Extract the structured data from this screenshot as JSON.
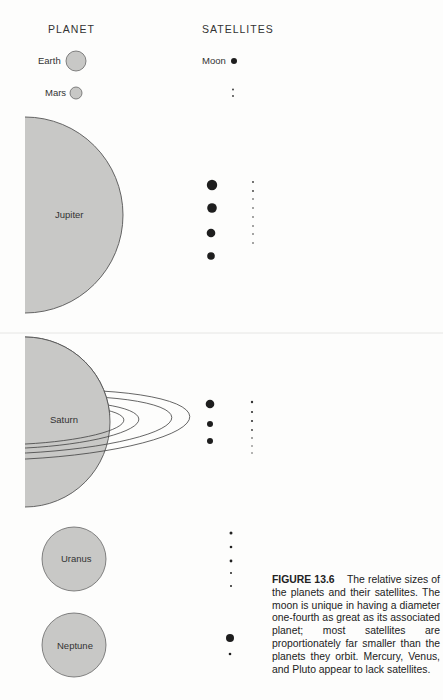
{
  "headers": {
    "planet": "PLANET",
    "satellites": "SATELLITES"
  },
  "planets": [
    {
      "name": "Earth",
      "satellite_label": "Moon",
      "satellite_count": 1
    },
    {
      "name": "Mars",
      "satellite_count": 2
    },
    {
      "name": "Jupiter",
      "major_satellites": 4,
      "minor_satellites": 8
    },
    {
      "name": "Saturn",
      "major_satellites": 3,
      "minor_satellites": 7
    },
    {
      "name": "Uranus",
      "satellite_count": 5
    },
    {
      "name": "Neptune",
      "satellite_count": 2
    }
  ],
  "caption": {
    "figure": "FIGURE 13.6",
    "text": "The relative sizes of the planets and their satellites. The moon is unique in having a diameter one-fourth as great as its associated planet; most satellites are proportionately far smaller than the planets they orbit. Mercury, Venus, and Pluto appear to lack satellites."
  },
  "colors": {
    "planet_fill": "#c8c8c6",
    "planet_stroke": "#555555",
    "moon_fill": "#1e1e1e"
  }
}
